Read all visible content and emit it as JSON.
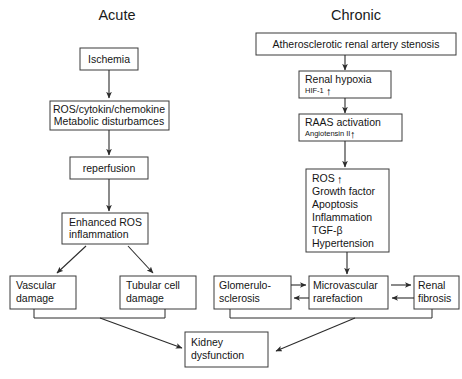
{
  "figure": {
    "background_color": "#ffffff",
    "line_color": "#2b2b2b",
    "box_border_color": "#3a3a3a",
    "text_color": "#151515"
  },
  "columns": [
    {
      "id": "acute",
      "label": "Acute"
    },
    {
      "id": "chronic",
      "label": "Chronic"
    }
  ],
  "acute": {
    "ischemia": {
      "line1": "Ischemia"
    },
    "ros_cytokine": {
      "line1": "ROS/cytokin/chemokine",
      "line2": "Metabolic disturbamces"
    },
    "reperfusion": {
      "line1": "reperfusion"
    },
    "enhanced_ros": {
      "line1": "Enhanced ROS",
      "line2": "inflammation"
    },
    "vascular_damage": {
      "line1": "Vascular",
      "line2": "damage"
    },
    "tubular_damage": {
      "line1": "Tubular cell",
      "line2": "damage"
    }
  },
  "chronic": {
    "stenosis": {
      "line1": "Atherosclerotic renal artery stenosis"
    },
    "renal_hypoxia": {
      "line1": "Renal hypoxia",
      "line2": "HIF-1",
      "arrow": "↑"
    },
    "raas": {
      "line1": "RAAS activation",
      "line2": "Angiotensin II",
      "arrow": "↑"
    },
    "ros": {
      "line1": "ROS",
      "arrow": "↑",
      "items": [
        "Growth factor",
        "Apoptosis",
        "Inflammation",
        "TGF-β",
        "Hypertension"
      ]
    },
    "glomerulosclerosis": {
      "line1": "Glomerulo-",
      "line2": "sclerosis"
    },
    "microvascular": {
      "line1": "Microvascular",
      "line2": "rarefaction"
    },
    "renal_fibrosis": {
      "line1": "Renal",
      "line2": "fibrosis"
    }
  },
  "outcome": {
    "kidney_dysfunction": {
      "line1": "Kidney",
      "line2": "dysfunction"
    }
  }
}
